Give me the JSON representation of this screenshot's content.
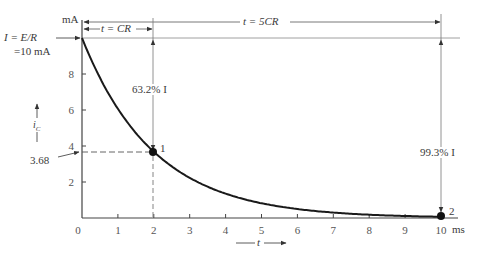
{
  "chart_data": {
    "type": "line",
    "title": "",
    "xlabel": "t",
    "ylabel": "i_C",
    "x_unit": "ms",
    "y_unit": "mA",
    "xlim": [
      0,
      10
    ],
    "ylim": [
      0,
      10
    ],
    "x_ticks": [
      0,
      1,
      2,
      3,
      4,
      5,
      6,
      7,
      8,
      9,
      10
    ],
    "y_ticks": [
      2,
      4,
      6,
      8
    ],
    "grid": false,
    "series": [
      {
        "name": "i_C = I e^{-t/CR}",
        "time_constant_ms": 2,
        "x": [
          0,
          0.5,
          1,
          1.5,
          2,
          2.5,
          3,
          3.5,
          4,
          4.5,
          5,
          5.5,
          6,
          6.5,
          7,
          7.5,
          8,
          8.5,
          9,
          9.5,
          10
        ],
        "values": [
          10,
          7.79,
          6.07,
          4.72,
          3.68,
          2.87,
          2.23,
          1.74,
          1.35,
          1.05,
          0.82,
          0.64,
          0.5,
          0.39,
          0.3,
          0.24,
          0.18,
          0.14,
          0.11,
          0.09,
          0.07
        ]
      }
    ],
    "points": [
      {
        "label": "1",
        "x": 2,
        "y": 3.68
      },
      {
        "label": "2",
        "x": 10,
        "y": 0.07
      }
    ],
    "annotations": {
      "initial_current": "I = E/R",
      "initial_value": "=10 mA",
      "y_unit_label": "mA",
      "x_unit_label": "ms",
      "tau_span": "t = CR",
      "five_tau_span": "t = 5CR",
      "drop_at_tau": "63.2% I",
      "drop_at_five_tau": "99.3% I",
      "value_at_tau": "3.68",
      "point1_label": "1",
      "point2_label": "2"
    }
  }
}
